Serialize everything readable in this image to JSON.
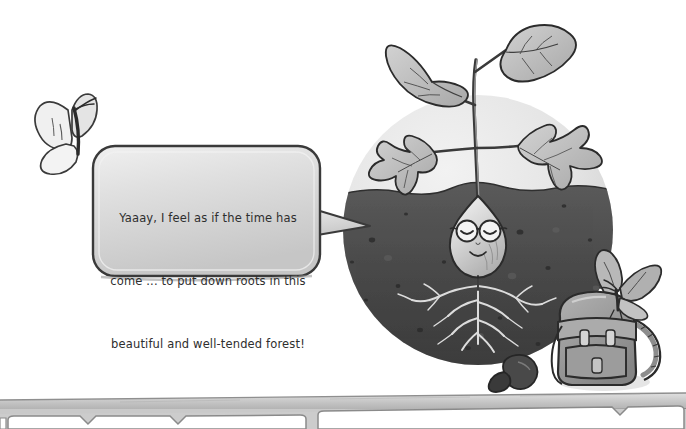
{
  "illustration": {
    "title": "Seed character planting roots in forest soil",
    "style": "grayscale pencil and watercolor children's book illustration",
    "palette": {
      "background": "#ffffff",
      "sky_circle_light": "#e9e9e9",
      "sky_circle_shadow": "#d2d2d2",
      "soil_dark": "#4a4a4a",
      "soil_shadow": "#3a3a3a",
      "outline": "#2b2b2b",
      "leaf_fill": "#b5b5b5",
      "leaf_light": "#cfcfcf",
      "seed_body": "#c9c9c9",
      "seed_highlight": "#e8e8e8",
      "bubble_fill": "#d8d8d8",
      "bubble_highlight": "#efefef",
      "bubble_outline": "#3a3a3a",
      "text": "#2e2e2e",
      "backpack": "#9a9a9a",
      "butterfly_wing": "#ededed",
      "band_fill": "#bdbdbd",
      "band_light": "#d6d6d6",
      "root_light": "#dcdcdc",
      "acorn_dark": "#3f3f3f"
    }
  },
  "speech_bubble": {
    "speaker": "seed-character",
    "text": "Yaaay, I feel as if the time has come ... to put down roots in this beautiful and well-tended forest!",
    "lines": [
      "Yaaay, I feel as if the time has",
      "come ... to put down roots in this",
      "beautiful and well-tended forest!"
    ],
    "tail_direction": "right"
  },
  "characters": {
    "seed": {
      "name": "seed-character",
      "expression": "content, eyes closed, smiling",
      "accessory": "round eyeglasses",
      "position": "center of soil"
    },
    "butterfly_left": {
      "name": "butterfly-flying",
      "position": "upper left"
    },
    "butterfly_backpack": {
      "name": "butterfly-on-backpack",
      "position": "lower right, perched on backpack"
    }
  },
  "objects": {
    "backpack": {
      "name": "backpack",
      "position": "lower right"
    },
    "acorn": {
      "name": "acorn-seed",
      "position": "bottom center-right"
    },
    "sprout": {
      "name": "sprout-plant",
      "leaf_count": 4
    },
    "roots": {
      "name": "root-system",
      "position": "below seed in soil"
    },
    "soil": {
      "name": "soil-ground"
    },
    "vignette": {
      "name": "circular-vignette"
    },
    "bottom_band": {
      "name": "decorative-bottom-band",
      "panels": 3
    }
  }
}
